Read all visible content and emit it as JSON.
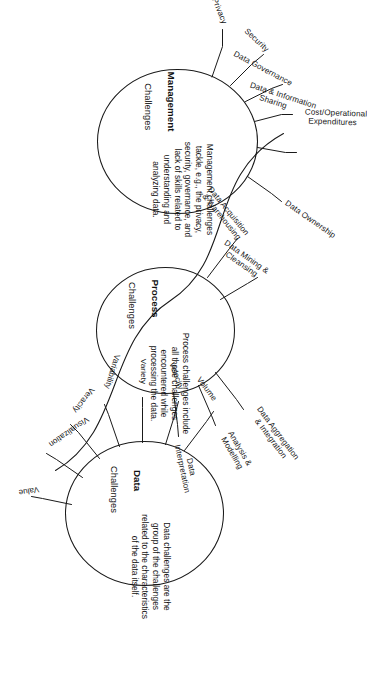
{
  "diagram": {
    "orientation_degrees": 90,
    "stroke_color": "#1a1a1a",
    "background_color": "#ffffff",
    "nodes": [
      {
        "id": "management",
        "title_bold": "Management",
        "title_rest": "Challenges",
        "body": "Management challenges\ntackle, e.g., the privacy,\nsecurity, governance, and\nlack of skills related to\nunderstanding and\nanalyzing data.",
        "branches": [
          "Privacy",
          "Security",
          "Data Governance",
          "Data & Information\nSharing",
          "Cost/Operational\nExpenditures",
          "Data Ownership"
        ]
      },
      {
        "id": "process",
        "title_bold": "Process",
        "title_rest": "Challenges",
        "body": "Process challenges include\nall those challenges\nencountered while\nprocessing the data.",
        "branches": [
          "Data Acquisition\n& Warehousing",
          "Data Mining &\nCleansing",
          "Data Aggregation\n& Integration",
          "Analysis &\nModelling",
          "Data\nInterpretation"
        ]
      },
      {
        "id": "data",
        "title_bold": "Data",
        "title_rest": "Challenges",
        "body": "Data challenges are the\ngroup of the challenges\nrelated to the characteristics\nof the data itself.",
        "branches": [
          "Volume",
          "Velocity",
          "Variety",
          "Variability",
          "Veracity",
          "Visualization",
          "Value"
        ]
      }
    ]
  }
}
